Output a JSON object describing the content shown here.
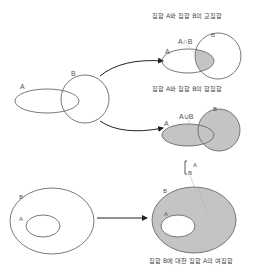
{
  "colors": {
    "stroke": "#6a6a6a",
    "shade": "#c4c4c4",
    "arrow": "#222222",
    "text": "#444444",
    "leader": "#aaaaaa"
  },
  "source": {
    "label_a": "A",
    "label_b": "B"
  },
  "intersection": {
    "title": "집합 A와 집합 B의 교집합",
    "label_a": "A",
    "label_b": "B",
    "notation": "A∩B"
  },
  "union": {
    "title": "집합 A와 집합 B의 합집합",
    "label_a": "A",
    "label_b": "B",
    "notation": "A∪B"
  },
  "complement_notation": {
    "bracket": "[",
    "top": "A",
    "bottom": "B"
  },
  "subset_source": {
    "label_a": "A",
    "label_b": "B"
  },
  "complement": {
    "title": "집합 B에 대한 집합 A의 여집합",
    "label_a": "A",
    "label_b": "B"
  }
}
